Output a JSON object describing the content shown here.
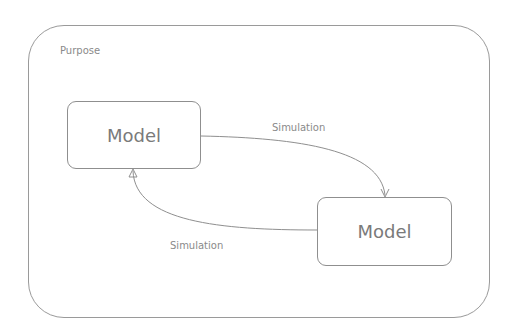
{
  "diagram": {
    "container": {
      "label": "Purpose"
    },
    "nodes": [
      {
        "id": "model-1",
        "label": "Model"
      },
      {
        "id": "model-2",
        "label": "Model"
      }
    ],
    "edges": [
      {
        "from": "model-1",
        "to": "model-2",
        "label": "Simulation"
      },
      {
        "from": "model-2",
        "to": "model-1",
        "label": "Simulation"
      }
    ],
    "colors": {
      "stroke": "#8f8f8f",
      "text": "#7a7a7a",
      "background": "#ffffff"
    }
  }
}
